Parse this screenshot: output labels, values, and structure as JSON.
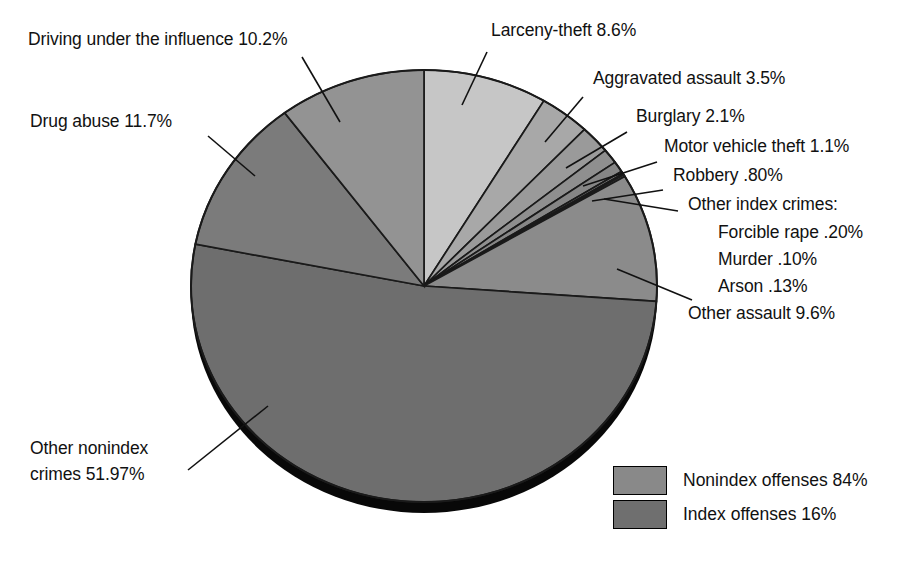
{
  "chart_data": {
    "type": "pie",
    "title": "",
    "unit": "percent",
    "total_label": "",
    "legend_position": "bottom-right",
    "grid": false,
    "categories": [
      "Larceny-theft",
      "Aggravated assault",
      "Burglary",
      "Motor vehicle theft",
      "Robbery",
      "Forcible rape",
      "Murder",
      "Arson",
      "Other assault",
      "Other nonindex crimes",
      "Drug abuse",
      "Driving under the influence"
    ],
    "values": [
      8.6,
      3.5,
      2.1,
      1.1,
      0.8,
      0.2,
      0.1,
      0.13,
      9.6,
      51.97,
      11.7,
      10.2
    ],
    "value_labels": [
      "8.6%",
      "3.5%",
      "2.1%",
      "1.1%",
      ".80%",
      ".20%",
      ".10%",
      ".13%",
      "9.6%",
      "51.97%",
      "11.7%",
      "10.2%"
    ],
    "slice_colors": [
      "#c6c6c6",
      "#a8a8a8",
      "#9a9a9a",
      "#8f8f8f",
      "#868686",
      "#7e7e7e",
      "#787878",
      "#737373",
      "#8b8b8b",
      "#6e6e6e",
      "#7b7b7b",
      "#939393"
    ],
    "groups": [
      "index",
      "index",
      "index",
      "index",
      "index",
      "index",
      "index",
      "index",
      "nonindex",
      "nonindex",
      "nonindex",
      "nonindex"
    ]
  },
  "labels": {
    "driving_under_influence": "Driving under the influence 10.2%",
    "drug_abuse": "Drug abuse 11.7%",
    "larceny_theft": "Larceny-theft 8.6%",
    "aggravated_assault": "Aggravated assault 3.5%",
    "burglary": "Burglary 2.1%",
    "motor_vehicle_theft": "Motor vehicle theft 1.1%",
    "robbery": "Robbery .80%",
    "other_index_crimes_header": "Other index crimes:",
    "forcible_rape": "Forcible rape .20%",
    "murder": "Murder .10%",
    "arson": "Arson .13%",
    "other_assault": "Other assault 9.6%",
    "other_nonindex_crimes_line1": "Other nonindex",
    "other_nonindex_crimes_line2": "crimes 51.97%"
  },
  "legend": {
    "items": [
      {
        "label": "Nonindex offenses 84%",
        "color": "#898989"
      },
      {
        "label": "Index offenses 16%",
        "color": "#6f6f6f"
      }
    ]
  },
  "colors": {
    "background": "#ffffff",
    "outline": "#1a1a1a",
    "shadow": "#090909",
    "text": "#111111"
  }
}
